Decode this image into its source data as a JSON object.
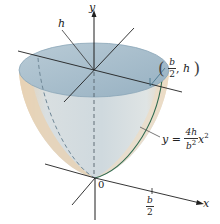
{
  "figure": {
    "title": "",
    "colors": {
      "surface_light": "#dbe3e6",
      "surface_shadow": "#c9d4d9",
      "outer_rim": "#e8d2b5",
      "top_disk": "#a9bfcd",
      "top_disk_edge": "#8aa6b8",
      "axis": "#1f1f1f",
      "curve": "#2e6a4f",
      "leader": "#555555"
    }
  },
  "labels": {
    "y_axis": "y",
    "x_axis": "x",
    "origin": "0",
    "height": "h",
    "point": {
      "open": "(",
      "x_num": "b",
      "x_den": "2",
      "sep": ",",
      "y": "h",
      "close": ")"
    },
    "equation": {
      "lhs": "y",
      "eq": "=",
      "num": "4h",
      "den_base": "b",
      "den_exp": "2",
      "var": "x",
      "var_exp": "2"
    },
    "x_tick": {
      "num": "b",
      "den": "2"
    }
  }
}
